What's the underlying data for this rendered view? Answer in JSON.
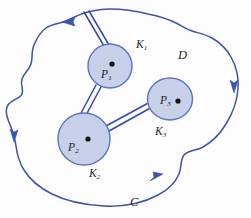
{
  "figure": {
    "colors": {
      "curve_stroke": "#3a52b0",
      "disk_fill": "#c7cfe9",
      "disk_stroke": "#5c74c4",
      "slit_stroke": "#3448ae",
      "label_text": "#1d1d1f",
      "background": "#fdfdfd",
      "center_dot": "#101014"
    },
    "labels": {
      "region": "D",
      "outer_curve": "C",
      "point_1_base": "P",
      "point_1_sub": "1",
      "point_2_base": "P",
      "point_2_sub": "2",
      "point_3_base": "P",
      "point_3_sub": "3",
      "disk_1_base": "K",
      "disk_1_sub": "1",
      "disk_2_base": "K",
      "disk_2_sub": "2",
      "disk_3_base": "K",
      "disk_3_sub": "3"
    },
    "disks": [
      {
        "name": "K1",
        "cx": 110,
        "cy": 66,
        "rx": 22,
        "ry": 22
      },
      {
        "name": "K2",
        "cx": 84,
        "cy": 139,
        "rx": 26,
        "ry": 26
      },
      {
        "name": "K3",
        "cx": 170,
        "cy": 99,
        "rx": 22.5,
        "ry": 21
      }
    ],
    "centers": [
      {
        "name": "P1",
        "cx": 112,
        "cy": 64
      },
      {
        "name": "P2",
        "cx": 88,
        "cy": 139
      },
      {
        "name": "P3",
        "cx": 178,
        "cy": 101
      }
    ],
    "arrows": [
      {
        "name": "top-arrow",
        "direction": "left",
        "x": 68,
        "y": 21
      },
      {
        "name": "right-arrow",
        "direction": "down",
        "x": 234,
        "y": 86
      },
      {
        "name": "left-arrow",
        "direction": "down",
        "x": 15,
        "y": 135
      },
      {
        "name": "bottom-arrow",
        "direction": "up-right",
        "x": 156,
        "y": 177
      }
    ]
  }
}
